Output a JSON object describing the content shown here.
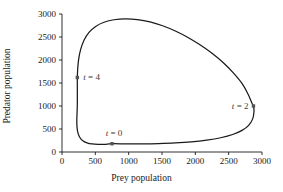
{
  "figure": {
    "background_color": "#ffffff",
    "line_color": "#1a1a1a",
    "marker_color": "#555555",
    "axis_color": "#1a1a1a"
  },
  "chart_data": {
    "type": "line",
    "title": "",
    "subtitle": "",
    "xlabel": "Prey population",
    "ylabel": "Predator population",
    "xlim": [
      0,
      3000
    ],
    "ylim": [
      0,
      3000
    ],
    "xticks": [
      0,
      500,
      1000,
      1500,
      2000,
      2500,
      3000
    ],
    "yticks": [
      0,
      500,
      1000,
      1500,
      2000,
      2500,
      3000
    ],
    "xtick_labels": [
      "0",
      "500",
      "1000",
      "1500",
      "2000",
      "2500",
      "3000"
    ],
    "ytick_labels": [
      "0",
      "500",
      "1000",
      "1500",
      "2000",
      "2500",
      "3000"
    ],
    "grid": false,
    "legend": false,
    "legend_position": "none",
    "series": [
      {
        "name": "predator-prey limit cycle",
        "closed": true,
        "points": [
          [
            750,
            180
          ],
          [
            640,
            168
          ],
          [
            540,
            165
          ],
          [
            450,
            175
          ],
          [
            375,
            200
          ],
          [
            312,
            245
          ],
          [
            268,
            315
          ],
          [
            240,
            410
          ],
          [
            226,
            530
          ],
          [
            222,
            680
          ],
          [
            226,
            850
          ],
          [
            230,
            1050
          ],
          [
            230,
            1250
          ],
          [
            230,
            1450
          ],
          [
            230,
            1620
          ],
          [
            236,
            1820
          ],
          [
            250,
            2020
          ],
          [
            280,
            2230
          ],
          [
            330,
            2430
          ],
          [
            405,
            2600
          ],
          [
            505,
            2730
          ],
          [
            630,
            2820
          ],
          [
            780,
            2875
          ],
          [
            950,
            2895
          ],
          [
            1130,
            2880
          ],
          [
            1320,
            2830
          ],
          [
            1510,
            2745
          ],
          [
            1700,
            2630
          ],
          [
            1890,
            2490
          ],
          [
            2070,
            2330
          ],
          [
            2250,
            2145
          ],
          [
            2420,
            1940
          ],
          [
            2570,
            1720
          ],
          [
            2700,
            1490
          ],
          [
            2790,
            1260
          ],
          [
            2850,
            1060
          ],
          [
            2872,
            1000
          ],
          [
            2880,
            880
          ],
          [
            2860,
            720
          ],
          [
            2800,
            580
          ],
          [
            2700,
            470
          ],
          [
            2560,
            380
          ],
          [
            2380,
            310
          ],
          [
            2170,
            258
          ],
          [
            1940,
            220
          ],
          [
            1700,
            196
          ],
          [
            1450,
            182
          ],
          [
            1200,
            176
          ],
          [
            980,
            176
          ],
          [
            750,
            180
          ]
        ]
      }
    ],
    "annotations": [
      {
        "id": "t0",
        "label_prefix": "t",
        "label_eq": " = ",
        "label_value": "0",
        "text": "t = 0",
        "x": 750,
        "y": 180,
        "text_placement": "above",
        "marker": true
      },
      {
        "id": "t2",
        "label_prefix": "t",
        "label_eq": " = ",
        "label_value": "2",
        "text": "t = 2",
        "x": 2872,
        "y": 1000,
        "text_placement": "left",
        "marker": true
      },
      {
        "id": "t4",
        "label_prefix": "t",
        "label_eq": " = ",
        "label_value": "4",
        "text": "t = 4",
        "x": 230,
        "y": 1620,
        "text_placement": "right",
        "marker": true
      }
    ]
  }
}
